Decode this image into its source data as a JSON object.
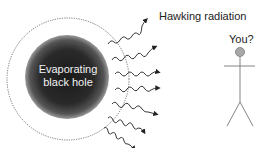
{
  "diagram": {
    "black_hole": {
      "label_line1": "Evaporating",
      "label_line2": "black hole"
    },
    "radiation_label": "Hawking radiation",
    "observer_label": "You?",
    "colors": {
      "hole_core": "#1a1a1a",
      "hole_edge": "#8a8a8a",
      "wave": "#222222",
      "observer_head": "#a8a8a8",
      "stick": "#777777"
    },
    "rays": 7
  }
}
